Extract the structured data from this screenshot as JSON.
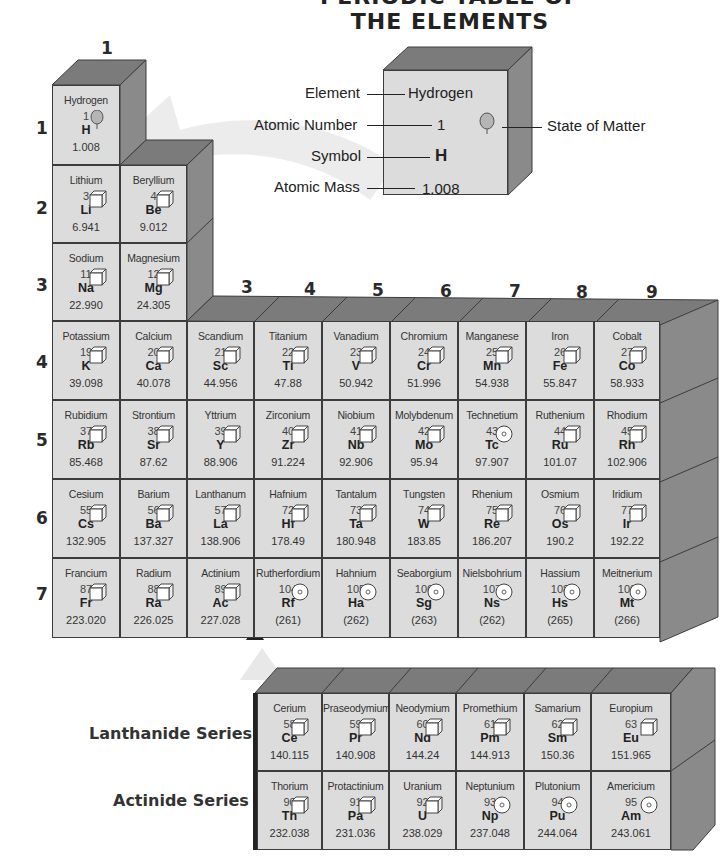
{
  "title": "PERIODIC TABLE OF THE ELEMENTS",
  "key": {
    "labels": {
      "element": "Element",
      "atomic_number": "Atomic Number",
      "symbol": "Symbol",
      "atomic_mass": "Atomic Mass",
      "state": "State of Matter"
    },
    "values": {
      "element": "Hydrogen",
      "atomic_number": "1",
      "symbol": "H",
      "atomic_mass": "1.008",
      "state_icon": "gas-balloon-icon"
    }
  },
  "groups": [
    "1",
    "2",
    "3",
    "4",
    "5",
    "6",
    "7",
    "8",
    "9"
  ],
  "periods": [
    "1",
    "2",
    "3",
    "4",
    "5",
    "6",
    "7"
  ],
  "state_legend": {
    "gas": "balloon-icon",
    "solid": "cube-icon",
    "synthetic": "target-circle-icon"
  },
  "elements": [
    {
      "name": "Hydrogen",
      "number": "1",
      "symbol": "H",
      "mass": "1.008",
      "state": "gas",
      "period": 1,
      "group": 1
    },
    {
      "name": "Lithium",
      "number": "3",
      "symbol": "Li",
      "mass": "6.941",
      "state": "solid",
      "period": 2,
      "group": 1
    },
    {
      "name": "Beryllium",
      "number": "4",
      "symbol": "Be",
      "mass": "9.012",
      "state": "solid",
      "period": 2,
      "group": 2
    },
    {
      "name": "Sodium",
      "number": "11",
      "symbol": "Na",
      "mass": "22.990",
      "state": "solid",
      "period": 3,
      "group": 1
    },
    {
      "name": "Magnesium",
      "number": "12",
      "symbol": "Mg",
      "mass": "24.305",
      "state": "solid",
      "period": 3,
      "group": 2
    },
    {
      "name": "Potassium",
      "number": "19",
      "symbol": "K",
      "mass": "39.098",
      "state": "solid",
      "period": 4,
      "group": 1
    },
    {
      "name": "Calcium",
      "number": "20",
      "symbol": "Ca",
      "mass": "40.078",
      "state": "solid",
      "period": 4,
      "group": 2
    },
    {
      "name": "Scandium",
      "number": "21",
      "symbol": "Sc",
      "mass": "44.956",
      "state": "solid",
      "period": 4,
      "group": 3
    },
    {
      "name": "Titanium",
      "number": "22",
      "symbol": "Ti",
      "mass": "47.88",
      "state": "solid",
      "period": 4,
      "group": 4
    },
    {
      "name": "Vanadium",
      "number": "23",
      "symbol": "V",
      "mass": "50.942",
      "state": "solid",
      "period": 4,
      "group": 5
    },
    {
      "name": "Chromium",
      "number": "24",
      "symbol": "Cr",
      "mass": "51.996",
      "state": "solid",
      "period": 4,
      "group": 6
    },
    {
      "name": "Manganese",
      "number": "25",
      "symbol": "Mn",
      "mass": "54.938",
      "state": "solid",
      "period": 4,
      "group": 7
    },
    {
      "name": "Iron",
      "number": "26",
      "symbol": "Fe",
      "mass": "55.847",
      "state": "solid",
      "period": 4,
      "group": 8
    },
    {
      "name": "Cobalt",
      "number": "27",
      "symbol": "Co",
      "mass": "58.933",
      "state": "solid",
      "period": 4,
      "group": 9
    },
    {
      "name": "Rubidium",
      "number": "37",
      "symbol": "Rb",
      "mass": "85.468",
      "state": "solid",
      "period": 5,
      "group": 1
    },
    {
      "name": "Strontium",
      "number": "38",
      "symbol": "Sr",
      "mass": "87.62",
      "state": "solid",
      "period": 5,
      "group": 2
    },
    {
      "name": "Yttrium",
      "number": "39",
      "symbol": "Y",
      "mass": "88.906",
      "state": "solid",
      "period": 5,
      "group": 3
    },
    {
      "name": "Zirconium",
      "number": "40",
      "symbol": "Zr",
      "mass": "91.224",
      "state": "solid",
      "period": 5,
      "group": 4
    },
    {
      "name": "Niobium",
      "number": "41",
      "symbol": "Nb",
      "mass": "92.906",
      "state": "solid",
      "period": 5,
      "group": 5
    },
    {
      "name": "Molybdenum",
      "number": "42",
      "symbol": "Mo",
      "mass": "95.94",
      "state": "solid",
      "period": 5,
      "group": 6
    },
    {
      "name": "Technetium",
      "number": "43",
      "symbol": "Tc",
      "mass": "97.907",
      "state": "synthetic",
      "period": 5,
      "group": 7
    },
    {
      "name": "Ruthenium",
      "number": "44",
      "symbol": "Ru",
      "mass": "101.07",
      "state": "solid",
      "period": 5,
      "group": 8
    },
    {
      "name": "Rhodium",
      "number": "45",
      "symbol": "Rh",
      "mass": "102.906",
      "state": "solid",
      "period": 5,
      "group": 9
    },
    {
      "name": "Cesium",
      "number": "55",
      "symbol": "Cs",
      "mass": "132.905",
      "state": "solid",
      "period": 6,
      "group": 1
    },
    {
      "name": "Barium",
      "number": "56",
      "symbol": "Ba",
      "mass": "137.327",
      "state": "solid",
      "period": 6,
      "group": 2
    },
    {
      "name": "Lanthanum",
      "number": "57",
      "symbol": "La",
      "mass": "138.906",
      "state": "solid",
      "period": 6,
      "group": 3
    },
    {
      "name": "Hafnium",
      "number": "72",
      "symbol": "Hf",
      "mass": "178.49",
      "state": "solid",
      "period": 6,
      "group": 4
    },
    {
      "name": "Tantalum",
      "number": "73",
      "symbol": "Ta",
      "mass": "180.948",
      "state": "solid",
      "period": 6,
      "group": 5
    },
    {
      "name": "Tungsten",
      "number": "74",
      "symbol": "W",
      "mass": "183.85",
      "state": "solid",
      "period": 6,
      "group": 6
    },
    {
      "name": "Rhenium",
      "number": "75",
      "symbol": "Re",
      "mass": "186.207",
      "state": "solid",
      "period": 6,
      "group": 7
    },
    {
      "name": "Osmium",
      "number": "76",
      "symbol": "Os",
      "mass": "190.2",
      "state": "solid",
      "period": 6,
      "group": 8
    },
    {
      "name": "Iridium",
      "number": "77",
      "symbol": "Ir",
      "mass": "192.22",
      "state": "solid",
      "period": 6,
      "group": 9
    },
    {
      "name": "Francium",
      "number": "87",
      "symbol": "Fr",
      "mass": "223.020",
      "state": "solid",
      "period": 7,
      "group": 1
    },
    {
      "name": "Radium",
      "number": "88",
      "symbol": "Ra",
      "mass": "226.025",
      "state": "solid",
      "period": 7,
      "group": 2
    },
    {
      "name": "Actinium",
      "number": "89",
      "symbol": "Ac",
      "mass": "227.028",
      "state": "solid",
      "period": 7,
      "group": 3
    },
    {
      "name": "Rutherfordium",
      "number": "104",
      "symbol": "Rf",
      "mass": "(261)",
      "state": "synthetic",
      "period": 7,
      "group": 4
    },
    {
      "name": "Hahnium",
      "number": "105",
      "symbol": "Ha",
      "mass": "(262)",
      "state": "synthetic",
      "period": 7,
      "group": 5
    },
    {
      "name": "Seaborgium",
      "number": "106",
      "symbol": "Sg",
      "mass": "(263)",
      "state": "synthetic",
      "period": 7,
      "group": 6
    },
    {
      "name": "Nielsbohrium",
      "number": "107",
      "symbol": "Ns",
      "mass": "(262)",
      "state": "synthetic",
      "period": 7,
      "group": 7
    },
    {
      "name": "Hassium",
      "number": "108",
      "symbol": "Hs",
      "mass": "(265)",
      "state": "synthetic",
      "period": 7,
      "group": 8
    },
    {
      "name": "Meitnerium",
      "number": "109",
      "symbol": "Mt",
      "mass": "(266)",
      "state": "synthetic",
      "period": 7,
      "group": 9
    }
  ],
  "series": {
    "lanthanide_label": "Lanthanide Series",
    "actinide_label": "Actinide Series",
    "lanthanides": [
      {
        "name": "Cerium",
        "number": "58",
        "symbol": "Ce",
        "mass": "140.115",
        "state": "solid"
      },
      {
        "name": "Praseodymium",
        "number": "59",
        "symbol": "Pr",
        "mass": "140.908",
        "state": "solid"
      },
      {
        "name": "Neodymium",
        "number": "60",
        "symbol": "Nd",
        "mass": "144.24",
        "state": "solid"
      },
      {
        "name": "Promethium",
        "number": "61",
        "symbol": "Pm",
        "mass": "144.913",
        "state": "solid"
      },
      {
        "name": "Samarium",
        "number": "62",
        "symbol": "Sm",
        "mass": "150.36",
        "state": "solid"
      },
      {
        "name": "Europium",
        "number": "63",
        "symbol": "Eu",
        "mass": "151.965",
        "state": "solid"
      }
    ],
    "actinides": [
      {
        "name": "Thorium",
        "number": "90",
        "symbol": "Th",
        "mass": "232.038",
        "state": "solid"
      },
      {
        "name": "Protactinium",
        "number": "91",
        "symbol": "Pa",
        "mass": "231.036",
        "state": "solid"
      },
      {
        "name": "Uranium",
        "number": "92",
        "symbol": "U",
        "mass": "238.029",
        "state": "solid"
      },
      {
        "name": "Neptunium",
        "number": "93",
        "symbol": "Np",
        "mass": "237.048",
        "state": "synthetic"
      },
      {
        "name": "Plutonium",
        "number": "94",
        "symbol": "Pu",
        "mass": "244.064",
        "state": "synthetic"
      },
      {
        "name": "Americium",
        "number": "95",
        "symbol": "Am",
        "mass": "243.061",
        "state": "synthetic"
      }
    ]
  },
  "colors": {
    "cell_face": "#dcdcdc",
    "cell_top": "#7b7b7b",
    "cell_side": "#8a8a8a",
    "border": "#3c3c3c",
    "arrow": "#efefef"
  }
}
